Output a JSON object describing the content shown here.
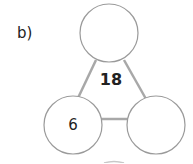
{
  "question_label": "b)",
  "triangle": {
    "total": "18",
    "parts": {
      "top": "",
      "bottom_left": "6",
      "bottom_right": ""
    }
  },
  "colors": {
    "line": "#a8a8a8",
    "circle_stroke": "#9a9a9a",
    "text": "#222222"
  }
}
